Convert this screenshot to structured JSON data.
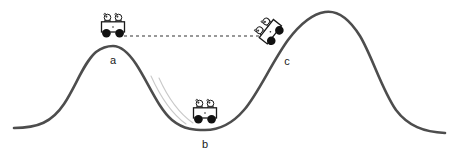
{
  "diagram": {
    "type": "roller-coaster-energy-diagram",
    "background_color": "#ffffff",
    "track": {
      "name": "roller-coaster-track",
      "color": "#4d4d4d",
      "stroke_width": 2.6,
      "path": "M 14,128 C 38,128 52,122 64,104 C 76,86 84,62 96,52 C 104,46 110,46 113,46 C 121,46 128,52 136,64 C 148,82 158,108 172,120 C 184,130 196,130 205,130 C 218,130 232,124 244,110 C 258,94 272,62 288,40 C 300,24 312,14 325,12 C 338,10 350,20 360,36 C 372,56 382,90 396,110 C 408,126 424,132 445,133",
      "peaks": [
        {
          "label": "left-hill-peak",
          "x": 113,
          "y": 46
        },
        {
          "label": "right-hill-peak",
          "x": 325,
          "y": 12
        }
      ],
      "valley": {
        "label": "valley-bottom",
        "x": 205,
        "y": 130
      },
      "left_end": {
        "x": 14,
        "y": 128
      },
      "right_end": {
        "x": 445,
        "y": 133
      }
    },
    "dashed_reference_line": {
      "name": "height-reference-line",
      "color": "#333333",
      "y": 36,
      "x_start": 124,
      "x_end": 262,
      "dash_pattern": "3,3",
      "stroke_width": 1.1
    },
    "motion_trails": {
      "name": "motion-trail-arcs",
      "color": "#c9c9c9",
      "stroke_width": 1.1,
      "arcs": [
        "M 151,76 C 160,96 172,114 186,124",
        "M 159,78 C 168,98 180,114 193,123"
      ]
    },
    "carts": [
      {
        "id": "cart-a",
        "label": "a",
        "label_x": 113,
        "label_y": 61,
        "center_x": 113,
        "center_y": 29,
        "rotation_deg": 0,
        "body_color": "#ffffff",
        "outline_color": "#1a1a1a",
        "wheel_color": "#111111",
        "riders": 2
      },
      {
        "id": "cart-b",
        "label": "b",
        "label_x": 205,
        "label_y": 145,
        "center_x": 205,
        "center_y": 115,
        "rotation_deg": 0,
        "body_color": "#ffffff",
        "outline_color": "#1a1a1a",
        "wheel_color": "#111111",
        "riders": 2
      },
      {
        "id": "cart-c",
        "label": "c",
        "label_x": 287,
        "label_y": 62,
        "center_x": 272,
        "center_y": 33,
        "rotation_deg": -52,
        "body_color": "#ffffff",
        "outline_color": "#1a1a1a",
        "wheel_color": "#111111",
        "riders": 2
      }
    ],
    "labels": [
      {
        "name": "position-label-a",
        "text": "a"
      },
      {
        "name": "position-label-b",
        "text": "b"
      },
      {
        "name": "position-label-c",
        "text": "c"
      }
    ]
  }
}
